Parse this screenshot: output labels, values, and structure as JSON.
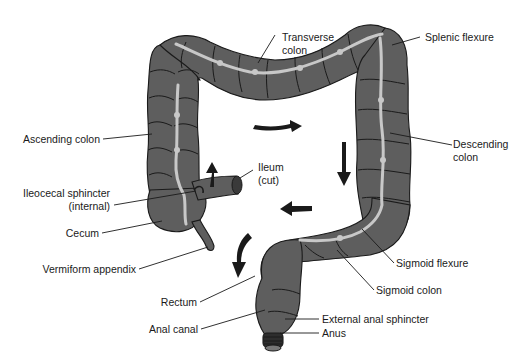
{
  "diagram": {
    "colors": {
      "background": "#ffffff",
      "colon_fill": "#5e5e5e",
      "outline": "#1a1a1a",
      "taenia": "#c8c8c8",
      "text": "#1a1a1a"
    },
    "labels": {
      "transverse_colon_1": "Transverse",
      "transverse_colon_2": "colon",
      "splenic_flexure": "Splenic flexure",
      "ascending_colon": "Ascending colon",
      "descending_colon_1": "Descending",
      "descending_colon_2": "colon",
      "ileum_1": "Ileum",
      "ileum_2": "(cut)",
      "ileocecal_sphincter_1": "Ileocecal sphincter",
      "ileocecal_sphincter_2": "(internal)",
      "cecum": "Cecum",
      "vermiform_appendix": "Vermiform appendix",
      "sigmoid_flexure": "Sigmoid flexure",
      "sigmoid_colon": "Sigmoid colon",
      "rectum": "Rectum",
      "anal_canal": "Anal canal",
      "external_anal_sphincter": "External anal sphincter",
      "anus": "Anus"
    },
    "arrows": [
      {
        "name": "flow-up-ascending",
        "direction": "up"
      },
      {
        "name": "flow-right-transverse",
        "direction": "right"
      },
      {
        "name": "flow-down-descending",
        "direction": "down"
      },
      {
        "name": "flow-left-sigmoid",
        "direction": "left"
      },
      {
        "name": "flow-down-rectum",
        "direction": "down-left"
      }
    ]
  }
}
